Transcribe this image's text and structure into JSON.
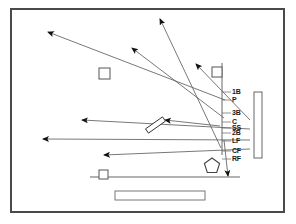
{
  "diagram": {
    "type": "spray-chart",
    "frame": {
      "border_color": "#4a4a4a",
      "background": "#ffffff",
      "x": 10,
      "y": 8,
      "width": 275,
      "height": 205
    },
    "stroke_color": "#555555",
    "marker_color": "#111111",
    "position_labels": [
      {
        "id": "1b",
        "text": "1B",
        "x": 232,
        "y": 92
      },
      {
        "id": "p",
        "text": "P",
        "x": 232,
        "y": 100
      },
      {
        "id": "3b",
        "text": "3B",
        "x": 232,
        "y": 113
      },
      {
        "id": "c",
        "text": "C",
        "x": 232,
        "y": 122
      },
      {
        "id": "ss",
        "text": "SS",
        "x": 232,
        "y": 128
      },
      {
        "id": "2b",
        "text": "2B",
        "x": 232,
        "y": 133
      },
      {
        "id": "lf",
        "text": "LF",
        "x": 232,
        "y": 141
      },
      {
        "id": "cf",
        "text": "CF",
        "x": 232,
        "y": 151
      },
      {
        "id": "rf",
        "text": "RF",
        "x": 232,
        "y": 159
      }
    ],
    "legend_bar": {
      "name": "legend-bar",
      "x": 254,
      "y": 92,
      "width": 8,
      "height": 66,
      "fill": "#ffffff",
      "stroke": "#666666"
    },
    "vertical_line": {
      "name": "foul-line-vertical",
      "x1": 222,
      "y1": 63,
      "x2": 222,
      "y2": 155
    },
    "horizontal_line": {
      "name": "field-baseline",
      "x1": 90,
      "y1": 177,
      "x2": 240,
      "y2": 177
    },
    "bottom_bar": {
      "name": "dugout-bar",
      "x": 115,
      "y": 191,
      "width": 90,
      "height": 9,
      "fill": "#ffffff",
      "stroke": "#777777"
    },
    "bases": [
      {
        "name": "base-square-left",
        "x": 99,
        "y": 68,
        "size": 11
      },
      {
        "name": "base-square-right",
        "x": 212,
        "y": 67,
        "size": 10
      },
      {
        "name": "base-square-home",
        "x": 99,
        "y": 170,
        "size": 9
      }
    ],
    "home_plate": {
      "name": "home-plate-pentagon",
      "cx": 212,
      "cy": 166,
      "r": 8
    },
    "bat": {
      "name": "bat-shape",
      "x1": 147,
      "y1": 131,
      "x2": 164,
      "y2": 119
    },
    "trajectories": [
      {
        "id": "t1",
        "from_x": 225,
        "from_y": 100,
        "to_x": 48,
        "to_y": 32
      },
      {
        "id": "t2",
        "from_x": 224,
        "from_y": 118,
        "to_x": 132,
        "to_y": 48
      },
      {
        "id": "t3",
        "from_x": 221,
        "from_y": 148,
        "to_x": 160,
        "to_y": 19
      },
      {
        "id": "t4",
        "from_x": 250,
        "from_y": 120,
        "to_x": 196,
        "to_y": 64
      },
      {
        "id": "t5",
        "from_x": 250,
        "from_y": 129,
        "to_x": 82,
        "to_y": 120
      },
      {
        "id": "t6",
        "from_x": 250,
        "from_y": 140,
        "to_x": 43,
        "to_y": 139
      },
      {
        "id": "t7",
        "from_x": 250,
        "from_y": 149,
        "to_x": 104,
        "to_y": 155
      },
      {
        "id": "t8",
        "from_x": 224,
        "from_y": 140,
        "to_x": 228,
        "to_y": 176
      },
      {
        "id": "t9",
        "from_x": 220,
        "from_y": 126,
        "to_x": 165,
        "to_y": 120
      }
    ]
  }
}
